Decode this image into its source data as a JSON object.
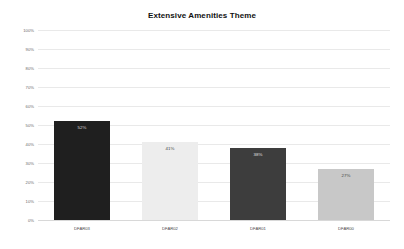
{
  "chart_data": {
    "type": "bar",
    "title": "Extensive Amenities Theme",
    "xlabel": "",
    "ylabel": "",
    "categories": [
      "DFAR03",
      "DFAR02",
      "DFAR01",
      "DFAR00"
    ],
    "values": [
      52,
      41,
      38,
      27
    ],
    "value_labels": [
      "52%",
      "41%",
      "38%",
      "27%"
    ],
    "bar_colors": [
      "#1f1f1f",
      "#ededed",
      "#3d3d3d",
      "#c8c8c8"
    ],
    "value_label_colors": [
      "#d8d8d8",
      "#444444",
      "#e0e0e0",
      "#444444"
    ],
    "ylim": [
      0,
      100
    ],
    "ytick_values": [
      100,
      90,
      80,
      70,
      60,
      50,
      40,
      30,
      20,
      10,
      0
    ],
    "ytick_labels": [
      "100%",
      "90%",
      "80%",
      "70%",
      "60%",
      "50%",
      "40%",
      "30%",
      "20%",
      "10%",
      "0%"
    ],
    "grid": true,
    "grid_color": "#e9e9e9",
    "legend": "none",
    "background": "#ffffff"
  }
}
